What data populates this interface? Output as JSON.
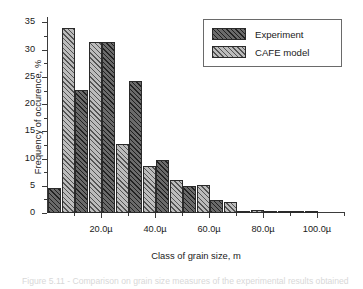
{
  "chart_data": {
    "type": "bar",
    "title": "",
    "xlabel": "Class of grain size, m",
    "ylabel": "Frequency of occurence, %",
    "ylim": [
      0,
      36
    ],
    "xlim": [
      0,
      110
    ],
    "grid": false,
    "legend_position": "top-right",
    "y_ticks": [
      0,
      5,
      10,
      15,
      20,
      25,
      30,
      35
    ],
    "y_tick_labels": [
      "0",
      "5",
      "10",
      "15",
      "20",
      "25",
      "30",
      "35"
    ],
    "x_ticks": [
      20,
      40,
      60,
      80,
      100
    ],
    "x_tick_labels": [
      "20.0µ",
      "40.0µ",
      "60.0µ",
      "80.0µ",
      "100.0µ"
    ],
    "categories": [
      "0-10",
      "10-20",
      "20-30",
      "30-40",
      "40-50",
      "50-60",
      "60-70",
      "70-80",
      "80-90",
      "90-100"
    ],
    "bin_centers": [
      5,
      15,
      25,
      35,
      45,
      55,
      65,
      75,
      85,
      95
    ],
    "series": [
      {
        "name": "Experiment",
        "color": "#4a4a4a",
        "hatch": "diagonal",
        "values": [
          4.6,
          22.6,
          31.5,
          24.3,
          9.7,
          5.0,
          2.3,
          0.2,
          0.3,
          0.1
        ]
      },
      {
        "name": "CAFE model",
        "color": "#8f8f8f",
        "hatch": "diagonal",
        "values": [
          33.9,
          31.4,
          12.7,
          8.6,
          6.1,
          5.1,
          2.0,
          0.6,
          0.15,
          0.15
        ]
      }
    ]
  },
  "legend": {
    "items": [
      {
        "label": "Experiment"
      },
      {
        "label": "CAFE model"
      }
    ]
  },
  "caption": {
    "text": "Figure 5.11 - Comparison on grain size measures of the experimental results obtained"
  }
}
